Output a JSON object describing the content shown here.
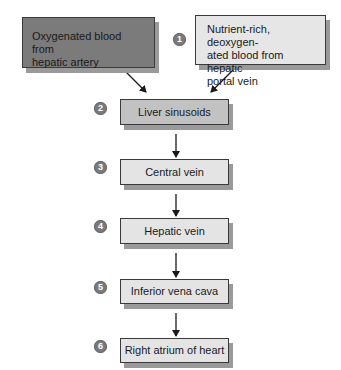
{
  "diagram": {
    "type": "flowchart",
    "colors": {
      "hepatic_artery_fill": "#7b7b7b",
      "portal_vein_fill": "#e6e6e6",
      "sinusoids_fill": "#c2c2c2",
      "step_fill": "#e4e4e4",
      "shadow": "#9a9a9a",
      "badge": "#7a7a7a",
      "arrow": "#1a1a1a"
    },
    "sources": [
      {
        "id": "hepatic-artery",
        "label": "Oxygenated blood from hepatic artery"
      },
      {
        "id": "portal-vein",
        "label": "Nutrient-rich, deoxygen-ated blood from hepatic portal vein"
      }
    ],
    "steps": [
      {
        "number": "1",
        "label": ""
      },
      {
        "number": "2",
        "label": "Liver sinusoids"
      },
      {
        "number": "3",
        "label": "Central vein"
      },
      {
        "number": "4",
        "label": "Hepatic vein"
      },
      {
        "number": "5",
        "label": "Inferior vena cava"
      },
      {
        "number": "6",
        "label": "Right atrium of heart"
      }
    ],
    "edges": [
      {
        "from": "hepatic-artery",
        "to": "Liver sinusoids"
      },
      {
        "from": "portal-vein",
        "to": "Liver sinusoids"
      },
      {
        "from": "Liver sinusoids",
        "to": "Central vein"
      },
      {
        "from": "Central vein",
        "to": "Hepatic vein"
      },
      {
        "from": "Hepatic vein",
        "to": "Inferior vena cava"
      },
      {
        "from": "Inferior vena cava",
        "to": "Right atrium of heart"
      }
    ]
  },
  "text": {
    "artery_line1": "Oxygenated blood from",
    "artery_line2": "hepatic artery",
    "portal_line1": "Nutrient-rich, deoxygen-",
    "portal_line2": "ated blood from hepatic",
    "portal_line3": "portal vein"
  }
}
